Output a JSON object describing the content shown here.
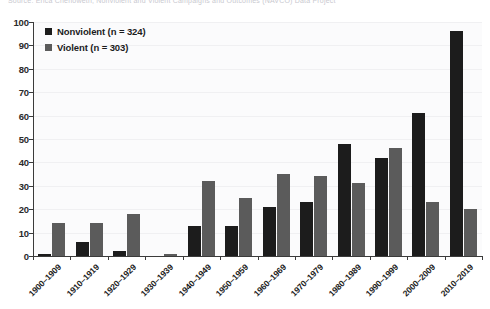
{
  "source_note": "Source: Erica Chenoweth, Nonviolent and Violent Campaigns and Outcomes (NAVCO) Data Project",
  "legend": {
    "items": [
      {
        "label": "Nonviolent (n = 324)",
        "color": "#1c1c1c",
        "key": "nonviolent"
      },
      {
        "label": "Violent (n = 303)",
        "color": "#5b5b5b",
        "key": "violent"
      }
    ]
  },
  "yaxis": {
    "ticks": [
      "0",
      "10",
      "20",
      "30",
      "40",
      "50",
      "60",
      "70",
      "80",
      "90",
      "100"
    ]
  },
  "chart_data": {
    "type": "bar",
    "title": "",
    "subtitle": "",
    "xlabel": "",
    "ylabel": "",
    "ylim": [
      0,
      100
    ],
    "ytick_step": 10,
    "grid": true,
    "legend_position": "top-left",
    "categories": [
      "1900-1909",
      "1910-1919",
      "1920-1929",
      "1930-1939",
      "1940-1949",
      "1950-1959",
      "1960-1969",
      "1970-1979",
      "1980-1989",
      "1990-1999",
      "2000-2009",
      "2010-2019"
    ],
    "series": [
      {
        "name": "Nonviolent (n = 324)",
        "color": "#1c1c1c",
        "values": [
          1,
          6,
          2,
          0,
          13,
          13,
          21,
          23,
          48,
          42,
          61,
          96
        ]
      },
      {
        "name": "Violent (n = 303)",
        "color": "#5b5b5b",
        "values": [
          14,
          14,
          18,
          1,
          32,
          25,
          35,
          34,
          31,
          46,
          23,
          20
        ]
      }
    ]
  }
}
